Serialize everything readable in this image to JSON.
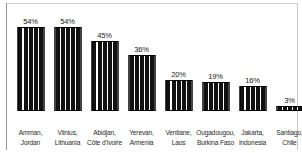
{
  "chart_data": {
    "type": "bar",
    "title": "",
    "subtitle": "",
    "xlabel": "",
    "ylabel": "",
    "ylim": [
      0,
      60
    ],
    "grid": false,
    "legend": null,
    "value_suffix": "%",
    "categories": [
      "Amman, Jordan",
      "Vilnius, Lithuania",
      "Abidjan, Côte d'Ivoire",
      "Yerevan, Armenia",
      "Ventiane, Laos",
      "Ougadougou, Burkina Faso",
      "Jakarta, Indonesia",
      "Santiago, Chile"
    ],
    "values": [
      54,
      54,
      45,
      36,
      20,
      19,
      16,
      3
    ],
    "bars": [
      {
        "city": "Amman,",
        "country": "Jordan",
        "value": 54,
        "label": "54%"
      },
      {
        "city": "Vilnius,",
        "country": "Lithuania",
        "value": 54,
        "label": "54%"
      },
      {
        "city": "Abidjan,",
        "country": "Côte d'Ivoire",
        "value": 45,
        "label": "45%"
      },
      {
        "city": "Yerevan,",
        "country": "Armenia",
        "value": 36,
        "label": "36%"
      },
      {
        "city": "Ventiane,",
        "country": "Laos",
        "value": 20,
        "label": "20%"
      },
      {
        "city": "Ougadougou,",
        "country": "Burkina Faso",
        "value": 19,
        "label": "19%"
      },
      {
        "city": "Jakarta,",
        "country": "Indonesia",
        "value": 16,
        "label": "16%"
      },
      {
        "city": "Santiago,",
        "country": "Chile",
        "value": 3,
        "label": "3%"
      }
    ],
    "colors": {
      "bar_fill": "#111111",
      "bar_stripe": "#ffffff",
      "bar_outline": "#000000",
      "value_text": "#1a1a1a",
      "label_text": "#2a2a2a",
      "background": "#ffffff",
      "axis_rule": "#9a9a9a"
    }
  }
}
